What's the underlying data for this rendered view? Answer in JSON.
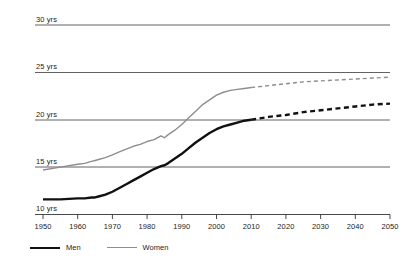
{
  "chart_data": {
    "type": "line",
    "title": "",
    "subtitle": "",
    "xlabel": "",
    "ylabel": "",
    "xlim": [
      1950,
      2050
    ],
    "ylim": [
      10,
      30
    ],
    "grid": true,
    "grid_axis": "y",
    "legend_position": "bottom-left",
    "y_ticklabels": [
      "30 yrs",
      "25 yrs",
      "20 yrs",
      "15 yrs",
      "10 yrs"
    ],
    "y_tickvalues": [
      30,
      25,
      20,
      15,
      10
    ],
    "x_ticklabels": [
      "1950",
      "1960",
      "1970",
      "1980",
      "1990",
      "2000",
      "2010",
      "2020",
      "2030",
      "2040",
      "2050"
    ],
    "x_tickvalues": [
      1950,
      1960,
      1970,
      1980,
      1990,
      2000,
      2010,
      2020,
      2030,
      2040,
      2050
    ],
    "projection_start": 2010,
    "x": [
      1950,
      1955,
      1960,
      1962,
      1964,
      1965,
      1966,
      1968,
      1970,
      1972,
      1974,
      1976,
      1978,
      1980,
      1982,
      1984,
      1985,
      1986,
      1988,
      1990,
      1992,
      1994,
      1996,
      1998,
      2000,
      2002,
      2004,
      2006,
      2008,
      2010,
      2015,
      2020,
      2025,
      2030,
      2035,
      2040,
      2045,
      2050
    ],
    "series": [
      {
        "name": "Men",
        "color": "#111111",
        "width": 2.4,
        "values": [
          11.6,
          11.6,
          11.7,
          11.7,
          11.8,
          11.8,
          11.9,
          12.1,
          12.4,
          12.8,
          13.2,
          13.6,
          14.0,
          14.4,
          14.8,
          15.1,
          15.2,
          15.4,
          15.9,
          16.4,
          17.0,
          17.6,
          18.1,
          18.6,
          19.0,
          19.3,
          19.5,
          19.7,
          19.9,
          20.0,
          20.3,
          20.5,
          20.8,
          21.0,
          21.2,
          21.4,
          21.6,
          21.7
        ]
      },
      {
        "name": "Women",
        "color": "#8e8e8e",
        "width": 1.4,
        "values": [
          14.7,
          15.0,
          15.3,
          15.4,
          15.6,
          15.7,
          15.8,
          16.0,
          16.3,
          16.6,
          16.9,
          17.2,
          17.4,
          17.7,
          17.9,
          18.3,
          18.1,
          18.4,
          18.9,
          19.5,
          20.2,
          20.9,
          21.6,
          22.1,
          22.6,
          22.9,
          23.1,
          23.2,
          23.3,
          23.4,
          23.6,
          23.8,
          24.0,
          24.1,
          24.2,
          24.3,
          24.4,
          24.5
        ]
      }
    ],
    "legend": [
      {
        "label": "Men",
        "style": "solid-thick-black"
      },
      {
        "label": "Women",
        "style": "solid-thin-gray"
      }
    ]
  }
}
